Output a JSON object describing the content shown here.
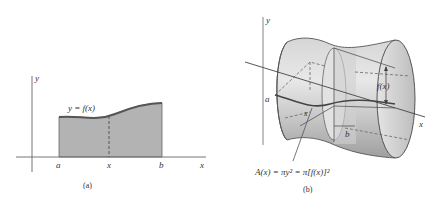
{
  "panel_a": {
    "caption": "(a)",
    "y_axis_label": "y",
    "x_axis_label": "x",
    "curve_label": "y = f(x)",
    "tick_a": "a",
    "tick_x": "x",
    "tick_b": "b",
    "fill_color": "#b3b3b3",
    "curve_color": "#555555"
  },
  "panel_b": {
    "caption": "(b)",
    "y_axis_label": "y",
    "x_axis_label": "x",
    "label_a": "a",
    "label_b": "b",
    "label_x": "x",
    "radius_label": "f(x)",
    "formula": "A(x) = πy² = π[f(x)]²",
    "surface_color": "#c8c8c8"
  }
}
